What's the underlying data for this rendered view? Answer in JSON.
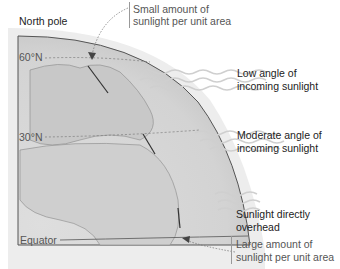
{
  "diagram": {
    "title": "North pole",
    "latitudes": [
      {
        "label": "60°N"
      },
      {
        "label": "30°N"
      },
      {
        "label": "Equator"
      }
    ],
    "annotations": {
      "top": {
        "line1": "Small amount of",
        "line2": "sunlight per unit area"
      },
      "bottom": {
        "line1": "Large amount of",
        "line2": "sunlight per unit area"
      }
    },
    "sunlight": [
      {
        "line1": "Low angle of",
        "line2": "incoming sunlight"
      },
      {
        "line1": "Moderate angle of",
        "line2": "incoming sunlight"
      },
      {
        "line1": "Sunlight directly",
        "line2": "overhead"
      }
    ],
    "colors": {
      "globe_fill": "#d9d9d9",
      "globe_edge": "#555555",
      "wave": "#d0d0d0",
      "text": "#222222"
    }
  }
}
